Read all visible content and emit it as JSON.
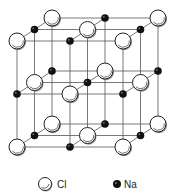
{
  "diagram": {
    "title": "",
    "type": "crystal-lattice",
    "grid": {
      "x_front": [
        17,
        70,
        123
      ],
      "y_front": [
        41,
        94,
        147
      ],
      "depth_dx": 17.5,
      "depth_dy": -11.5
    },
    "atoms": [
      {
        "type": "Cl",
        "i": 0,
        "j": 0,
        "k": 0
      },
      {
        "type": "Na",
        "i": 1,
        "j": 0,
        "k": 0
      },
      {
        "type": "Cl",
        "i": 2,
        "j": 0,
        "k": 0
      },
      {
        "type": "Na",
        "i": 0,
        "j": 0,
        "k": 1
      },
      {
        "type": "Cl",
        "i": 1,
        "j": 0,
        "k": 1
      },
      {
        "type": "Na",
        "i": 2,
        "j": 0,
        "k": 1
      },
      {
        "type": "Cl",
        "i": 0,
        "j": 0,
        "k": 2
      },
      {
        "type": "Na",
        "i": 1,
        "j": 0,
        "k": 2
      },
      {
        "type": "Cl",
        "i": 2,
        "j": 0,
        "k": 2
      },
      {
        "type": "Na",
        "i": 0,
        "j": 1,
        "k": 0
      },
      {
        "type": "Cl",
        "i": 1,
        "j": 1,
        "k": 0
      },
      {
        "type": "Na",
        "i": 2,
        "j": 1,
        "k": 0
      },
      {
        "type": "Cl",
        "i": 0,
        "j": 1,
        "k": 1
      },
      {
        "type": "Na",
        "i": 1,
        "j": 1,
        "k": 1
      },
      {
        "type": "Cl",
        "i": 2,
        "j": 1,
        "k": 1
      },
      {
        "type": "Na",
        "i": 0,
        "j": 1,
        "k": 2
      },
      {
        "type": "Cl",
        "i": 1,
        "j": 1,
        "k": 2
      },
      {
        "type": "Na",
        "i": 2,
        "j": 1,
        "k": 2
      },
      {
        "type": "Cl",
        "i": 0,
        "j": 2,
        "k": 0
      },
      {
        "type": "Na",
        "i": 1,
        "j": 2,
        "k": 0
      },
      {
        "type": "Cl",
        "i": 2,
        "j": 2,
        "k": 0
      },
      {
        "type": "Na",
        "i": 0,
        "j": 2,
        "k": 1
      },
      {
        "type": "Cl",
        "i": 1,
        "j": 2,
        "k": 1
      },
      {
        "type": "Na",
        "i": 2,
        "j": 2,
        "k": 1
      },
      {
        "type": "Cl",
        "i": 0,
        "j": 2,
        "k": 2
      },
      {
        "type": "Na",
        "i": 1,
        "j": 2,
        "k": 2
      },
      {
        "type": "Cl",
        "i": 2,
        "j": 2,
        "k": 2
      }
    ],
    "styles": {
      "line_color": "#555555",
      "cl_fill": "#ffffff",
      "cl_stroke": "#222222",
      "na_fill": "#111111",
      "cl_radius": 8,
      "na_radius": 3.8
    }
  },
  "legend": {
    "items": [
      {
        "symbol": "Cl",
        "label": "Cl",
        "icon": "large-white-sphere"
      },
      {
        "symbol": "Na",
        "label": "Na",
        "icon": "small-black-sphere"
      }
    ]
  }
}
